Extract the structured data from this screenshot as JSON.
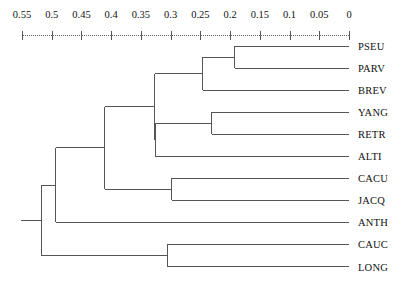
{
  "chart_data": {
    "type": "dendrogram",
    "title": "",
    "xlabel": "",
    "ylabel": "",
    "axis": {
      "position": "top",
      "orientation": "horizontal-reversed",
      "min": 0,
      "max": 0.55,
      "tick_values": [
        0.55,
        0.5,
        0.45,
        0.4,
        0.35,
        0.3,
        0.25,
        0.2,
        0.15,
        0.1,
        0.05,
        0
      ],
      "tick_labels": [
        "0.55",
        "0.5",
        "0.45",
        "0.4",
        "0.35",
        "0.3",
        "0.25",
        "0.2",
        "0.15",
        "0.1",
        "0.05",
        "0"
      ],
      "grid": false
    },
    "leaves": [
      {
        "label": "PSEU",
        "order": 0
      },
      {
        "label": "PARV",
        "order": 1
      },
      {
        "label": "BREV",
        "order": 2
      },
      {
        "label": "YANG",
        "order": 3
      },
      {
        "label": "RETR",
        "order": 4
      },
      {
        "label": "ALTI",
        "order": 5
      },
      {
        "label": "CACU",
        "order": 6
      },
      {
        "label": "JACQ",
        "order": 7
      },
      {
        "label": "ANTH",
        "order": 8
      },
      {
        "label": "CAUC",
        "order": 9
      },
      {
        "label": "LONG",
        "order": 10
      }
    ],
    "merges": [
      {
        "id": "m1",
        "members": [
          "PSEU",
          "PARV"
        ],
        "height": 0.192
      },
      {
        "id": "m2",
        "members": [
          "PSEU",
          "PARV",
          "BREV"
        ],
        "height": 0.246
      },
      {
        "id": "m3",
        "members": [
          "YANG",
          "RETR"
        ],
        "height": 0.231
      },
      {
        "id": "m4",
        "members": [
          "YANG",
          "RETR",
          "ALTI"
        ],
        "height": 0.326
      },
      {
        "id": "m5",
        "members": [
          "PSEU",
          "PARV",
          "BREV",
          "YANG",
          "RETR",
          "ALTI"
        ],
        "height": 0.327
      },
      {
        "id": "m6",
        "members": [
          "CACU",
          "JACQ"
        ],
        "height": 0.298
      },
      {
        "id": "m7",
        "members": [
          "PSEU",
          "PARV",
          "BREV",
          "YANG",
          "RETR",
          "ALTI",
          "CACU",
          "JACQ"
        ],
        "height": 0.411
      },
      {
        "id": "m8",
        "members": [
          "CAUC",
          "LONG"
        ],
        "height": 0.305
      },
      {
        "id": "m9",
        "members": [
          "PSEU",
          "PARV",
          "BREV",
          "YANG",
          "RETR",
          "ALTI",
          "CACU",
          "JACQ",
          "ANTH"
        ],
        "height": 0.493
      },
      {
        "id": "m10",
        "members": [
          "PSEU",
          "PARV",
          "BREV",
          "YANG",
          "RETR",
          "ALTI",
          "CACU",
          "JACQ",
          "ANTH",
          "CAUC",
          "LONG"
        ],
        "height": 0.518
      }
    ],
    "colors": {
      "line": "#555555",
      "text": "#111111",
      "background": "#ffffff"
    }
  }
}
